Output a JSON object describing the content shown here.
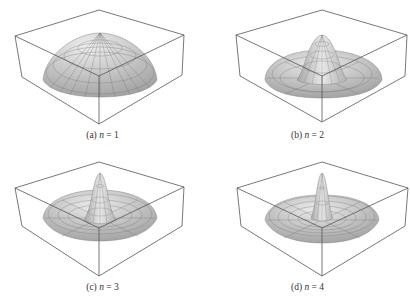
{
  "figure": {
    "panels": [
      {
        "id": "a",
        "label": "(a)",
        "var": "n",
        "eq": " = ",
        "value": "1",
        "peaks": 1
      },
      {
        "id": "b",
        "label": "(b)",
        "var": "n",
        "eq": " = ",
        "value": "2",
        "peaks": 2
      },
      {
        "id": "c",
        "label": "(c)",
        "var": "n",
        "eq": " = ",
        "value": "3",
        "peaks": 3
      },
      {
        "id": "d",
        "label": "(d)",
        "var": "n",
        "eq": " = ",
        "value": "4",
        "peaks": 4
      }
    ],
    "colors": {
      "box_line": "#555555",
      "surface_light": "#e6e6e6",
      "surface_dark": "#9a9a9a",
      "mesh": "#6e6e6e"
    }
  }
}
